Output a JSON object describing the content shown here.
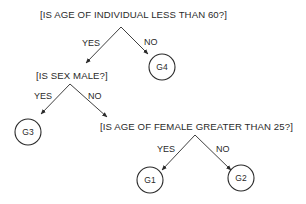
{
  "diagram": {
    "type": "decision-tree",
    "questions": {
      "q1": "[IS AGE OF INDIVIDUAL LESS THAN 60?]",
      "q2": "[IS SEX MALE?]",
      "q3": "[IS AGE OF FEMALE GREATER THAN 25?]"
    },
    "edge_labels": {
      "q1_yes": "YES",
      "q1_no": "NO",
      "q2_yes": "YES",
      "q2_no": "NO",
      "q3_yes": "YES",
      "q3_no": "NO"
    },
    "leaves": {
      "g1": "G1",
      "g2": "G2",
      "g3": "G3",
      "g4": "G4"
    },
    "structure": [
      {
        "from": "q1",
        "label": "YES",
        "to": "q2"
      },
      {
        "from": "q1",
        "label": "NO",
        "to": "g4"
      },
      {
        "from": "q2",
        "label": "YES",
        "to": "g3"
      },
      {
        "from": "q2",
        "label": "NO",
        "to": "q3"
      },
      {
        "from": "q3",
        "label": "YES",
        "to": "g1"
      },
      {
        "from": "q3",
        "label": "NO",
        "to": "g2"
      }
    ],
    "colors": {
      "ink": "#2a2a2a",
      "background": "#ffffff"
    }
  }
}
